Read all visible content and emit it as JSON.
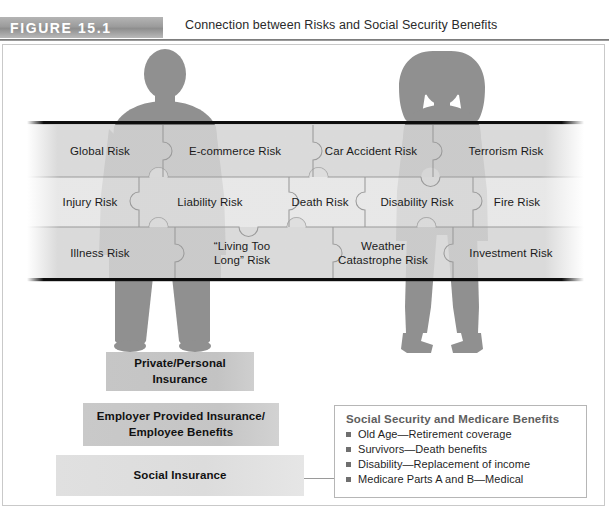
{
  "header": {
    "figure_tag": "FIGURE 15.1",
    "title": "Connection between Risks and Social Security Benefits"
  },
  "diagram": {
    "silhouettes": [
      {
        "name": "male-silhouette"
      },
      {
        "name": "female-silhouette"
      }
    ],
    "puzzle_rows": [
      {
        "row": "top",
        "pieces": [
          {
            "label": "Global Risk",
            "shade": "light"
          },
          {
            "label": "E-commerce Risk",
            "shade": "light"
          },
          {
            "label": "Car Accident Risk",
            "shade": "light"
          },
          {
            "label": "Terrorism Risk",
            "shade": "light"
          }
        ]
      },
      {
        "row": "middle",
        "pieces": [
          {
            "label": "Injury Risk",
            "shade": "lighter"
          },
          {
            "label": "Liability Risk",
            "shade": "lighter"
          },
          {
            "label": "Death Risk",
            "shade": "lighter"
          },
          {
            "label": "Disability Risk",
            "shade": "lighter"
          },
          {
            "label": "Fire Risk",
            "shade": "lighter"
          }
        ]
      },
      {
        "row": "bottom",
        "pieces": [
          {
            "label": "Illness Risk",
            "shade": "light"
          },
          {
            "label": "“Living Too",
            "label2": "Long” Risk",
            "shade": "light"
          },
          {
            "label": "Weather",
            "label2": "Catastrophe Risk",
            "shade": "light"
          },
          {
            "label": "Investment Risk",
            "shade": "light"
          }
        ]
      }
    ]
  },
  "pyramid": {
    "bars": [
      {
        "line1": "Private/Personal",
        "line2": "Insurance"
      },
      {
        "line1": "Employer Provided Insurance/",
        "line2": "Employee Benefits"
      },
      {
        "line1": "Social Insurance",
        "line2": ""
      }
    ]
  },
  "legend": {
    "title": "Social Security and Medicare Benefits",
    "items": [
      "Old Age—Retirement coverage",
      "Survivors—Death benefits",
      "Disability—Replacement of income",
      "Medicare Parts A and B—Medical"
    ]
  },
  "colors": {
    "tag_gray": "#9c9c9c",
    "rule_gray": "#6f6f6f",
    "silhouette": "#8f8f8f",
    "puzzle_light": "#d4d4d4",
    "puzzle_lighter": "#e3e3e3",
    "bar_gray": "#c5c5c5",
    "bar_light": "#dedede",
    "legend_border": "#b6b6b6"
  }
}
